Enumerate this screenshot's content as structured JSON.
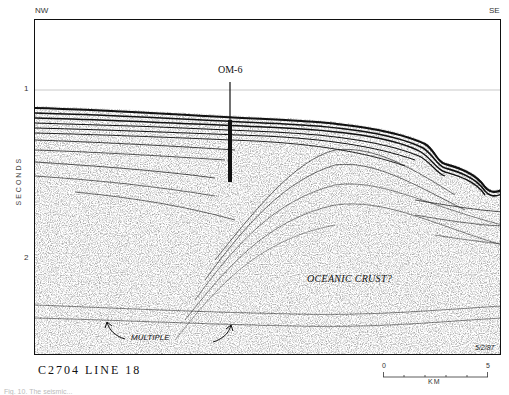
{
  "figure": {
    "orientation": {
      "left": "NW",
      "right": "SE"
    },
    "y_axis": {
      "label": "SECONDS",
      "ticks": [
        "1",
        "2"
      ]
    },
    "well": {
      "label": "OM-6"
    },
    "annotations": {
      "crust": "OCEANIC CRUST?",
      "multiple": "MULTIPLE"
    },
    "date": "5/2/87",
    "caption_line": "C2704  LINE  18",
    "scale_bar": {
      "start": "0",
      "end": "5",
      "unit": "KM"
    },
    "figure_caption_partial": "Fig. 10. The seismic..."
  }
}
